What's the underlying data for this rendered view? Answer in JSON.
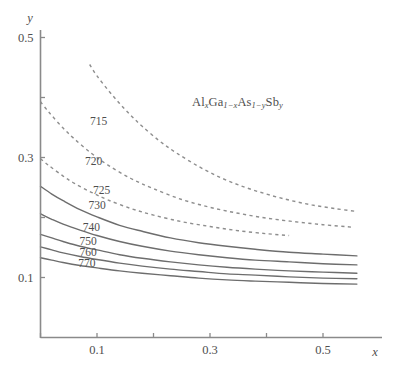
{
  "figure": {
    "background": "#ffffff",
    "annotation": {
      "name": "composition-formula",
      "parts": [
        "Al",
        "x",
        "Ga",
        "1−x",
        "As",
        "1−y",
        "Sb",
        "y"
      ],
      "plain": "AlxGa1-xAs1-ySby",
      "x": 192,
      "y": 95
    }
  },
  "chart_data": {
    "type": "line",
    "title": "",
    "subtitle": "",
    "annotation_text": "AlxGa1-xAs1-ySby",
    "xlabel": "x",
    "ylabel": "y",
    "xlim": [
      0,
      0.6
    ],
    "ylim": [
      0,
      0.56
    ],
    "grid": false,
    "legend": "inline-curve-labels",
    "x_ticks": [
      0,
      0.1,
      0.2,
      0.3,
      0.4,
      0.5
    ],
    "x_tick_labels": [
      "",
      "0.1",
      "",
      "0.3",
      "",
      "0.5"
    ],
    "y_ticks": [
      0.1,
      0.2,
      0.3,
      0.4,
      0.5
    ],
    "y_tick_labels": [
      "0.1",
      "",
      "0.3",
      "",
      "0.5"
    ],
    "series": [
      {
        "name": "715",
        "style": "dashed",
        "color": "#8e8e8e",
        "label_x": 0.103,
        "label_y": 0.355,
        "x": [
          0.087,
          0.1,
          0.12,
          0.14,
          0.16,
          0.18,
          0.21,
          0.24,
          0.28,
          0.32,
          0.36,
          0.4,
          0.44,
          0.48,
          0.52,
          0.56,
          0.6
        ],
        "y": [
          0.455,
          0.436,
          0.412,
          0.39,
          0.37,
          0.352,
          0.328,
          0.308,
          0.285,
          0.266,
          0.251,
          0.239,
          0.229,
          0.221,
          0.215,
          0.21,
          0.206
        ]
      },
      {
        "name": "720",
        "style": "dashed",
        "color": "#8e8e8e",
        "label_x": 0.094,
        "label_y": 0.288,
        "x": [
          0.0,
          0.01,
          0.02,
          0.04,
          0.06,
          0.09,
          0.12,
          0.16,
          0.2,
          0.25,
          0.3,
          0.35,
          0.4,
          0.45,
          0.5,
          0.55,
          0.6
        ],
        "y": [
          0.393,
          0.381,
          0.37,
          0.349,
          0.331,
          0.307,
          0.287,
          0.265,
          0.248,
          0.23,
          0.217,
          0.207,
          0.199,
          0.193,
          0.188,
          0.184,
          0.181
        ]
      },
      {
        "name": "725",
        "style": "dashed",
        "color": "#8e8e8e",
        "label_x": 0.108,
        "label_y": 0.24,
        "x": [
          0.0,
          0.01,
          0.02,
          0.04,
          0.06,
          0.09,
          0.12,
          0.16,
          0.2,
          0.25,
          0.3,
          0.35,
          0.4,
          0.44
        ],
        "y": [
          0.298,
          0.29,
          0.283,
          0.269,
          0.257,
          0.242,
          0.229,
          0.215,
          0.204,
          0.193,
          0.185,
          0.178,
          0.173,
          0.17
        ]
      },
      {
        "name": "730",
        "style": "solid",
        "color": "#6d6d6d",
        "label_x": 0.1,
        "label_y": 0.214,
        "x": [
          0.0,
          0.02,
          0.04,
          0.07,
          0.1,
          0.14,
          0.18,
          0.23,
          0.28,
          0.33,
          0.38,
          0.44,
          0.5,
          0.56,
          0.6
        ],
        "y": [
          0.252,
          0.239,
          0.228,
          0.213,
          0.201,
          0.187,
          0.177,
          0.166,
          0.158,
          0.152,
          0.147,
          0.142,
          0.139,
          0.136,
          0.135
        ]
      },
      {
        "name": "740",
        "style": "solid",
        "color": "#6d6d6d",
        "label_x": 0.09,
        "label_y": 0.178,
        "x": [
          0.0,
          0.02,
          0.04,
          0.07,
          0.1,
          0.14,
          0.18,
          0.23,
          0.28,
          0.33,
          0.38,
          0.44,
          0.5,
          0.56,
          0.6
        ],
        "y": [
          0.206,
          0.197,
          0.189,
          0.179,
          0.17,
          0.16,
          0.152,
          0.144,
          0.138,
          0.133,
          0.129,
          0.126,
          0.123,
          0.121,
          0.12
        ]
      },
      {
        "name": "750",
        "style": "solid",
        "color": "#6d6d6d",
        "label_x": 0.084,
        "label_y": 0.154,
        "x": [
          0.0,
          0.02,
          0.04,
          0.07,
          0.1,
          0.14,
          0.18,
          0.23,
          0.28,
          0.33,
          0.38,
          0.44,
          0.5,
          0.56,
          0.6
        ],
        "y": [
          0.172,
          0.166,
          0.16,
          0.152,
          0.146,
          0.138,
          0.132,
          0.126,
          0.121,
          0.117,
          0.114,
          0.111,
          0.109,
          0.107,
          0.106
        ]
      },
      {
        "name": "760",
        "style": "solid",
        "color": "#6d6d6d",
        "label_x": 0.084,
        "label_y": 0.136,
        "x": [
          0.0,
          0.02,
          0.04,
          0.07,
          0.1,
          0.14,
          0.18,
          0.23,
          0.28,
          0.33,
          0.38,
          0.44,
          0.5,
          0.56,
          0.6
        ],
        "y": [
          0.151,
          0.146,
          0.141,
          0.135,
          0.13,
          0.124,
          0.119,
          0.114,
          0.11,
          0.106,
          0.104,
          0.101,
          0.099,
          0.098,
          0.097
        ]
      },
      {
        "name": "770",
        "style": "solid",
        "color": "#6d6d6d",
        "label_x": 0.082,
        "label_y": 0.118,
        "x": [
          0.0,
          0.02,
          0.04,
          0.07,
          0.1,
          0.14,
          0.18,
          0.23,
          0.28,
          0.33,
          0.38,
          0.44,
          0.5,
          0.56,
          0.6
        ],
        "y": [
          0.133,
          0.129,
          0.125,
          0.12,
          0.116,
          0.111,
          0.107,
          0.103,
          0.099,
          0.096,
          0.094,
          0.092,
          0.09,
          0.089,
          0.088
        ]
      }
    ]
  }
}
